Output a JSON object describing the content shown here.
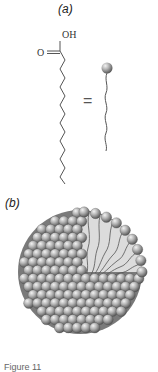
{
  "figure": {
    "panels": [
      {
        "label": "(a)",
        "content": "fatty acid structure equals bead-and-tail schematic",
        "chemistry": {
          "hydroxyl": "OH",
          "carbonyl_oxygen": "O",
          "equals_sign": "="
        }
      },
      {
        "label": "(b)",
        "content": "micelle cutaway: spherical head groups outside, hydrocarbon tails inside"
      }
    ],
    "caption_fragment": "Figure 11",
    "colors": {
      "bead": "#8a8a8a",
      "bead_highlight": "#e8e8e8",
      "chain": "#555555",
      "interior": "#d9d9d9",
      "interior_shadow": "#9a9a9a"
    }
  }
}
